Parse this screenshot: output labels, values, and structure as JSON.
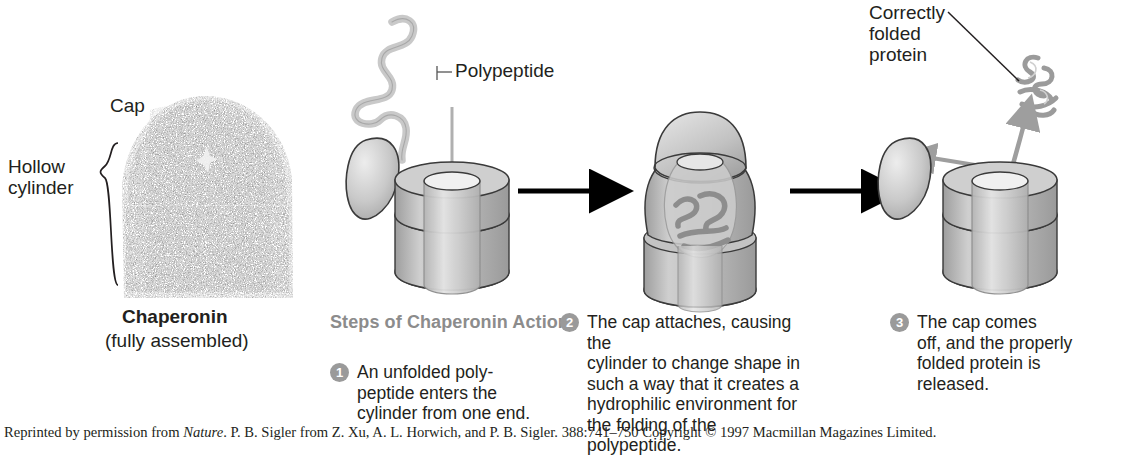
{
  "figure": {
    "left_panel": {
      "cap_label": "Cap",
      "hollow_label": "Hollow\ncylinder",
      "name": "Chaperonin",
      "subtitle": "(fully assembled)"
    },
    "callouts": {
      "polypeptide": "Polypeptide",
      "correctly_folded": "Correctly\nfolded\nprotein"
    },
    "steps_heading": "Steps of Chaperonin\nAction:",
    "steps": [
      {
        "number": "1",
        "text": "An unfolded poly-\npeptide enters the\ncylinder from one end."
      },
      {
        "number": "2",
        "text": "The cap attaches, causing the\ncylinder to change shape in\nsuch a way that it creates a\nhydrophilic environment for\nthe folding of the polypeptide."
      },
      {
        "number": "3",
        "text": "The cap comes\noff, and the properly\nfolded protein is\nreleased."
      }
    ],
    "credit": "Reprinted by permission from Nature. P. B. Sigler from Z. Xu, A. L. Horwich, and P. B. Sigler. 388:741–750 Copyright © 1997 Macmillan Magazines Limited.",
    "credit_italic_word": "Nature",
    "colors": {
      "text": "#231f20",
      "heading_gray": "#8c8c8c",
      "badge_gray": "#9a9a9a",
      "cylinder_fill": "#b3b3b3",
      "cap_fill": "#c6c6c6",
      "arrow_black": "#000000",
      "arrow_gray": "#9e9e9e",
      "protein_dark": "#4a4a4a"
    },
    "icons": [
      "polypeptide-chain-icon",
      "chaperonin-cylinder-icon",
      "chaperonin-cap-icon",
      "folded-protein-icon",
      "process-arrow-icon",
      "brace-icon"
    ]
  }
}
